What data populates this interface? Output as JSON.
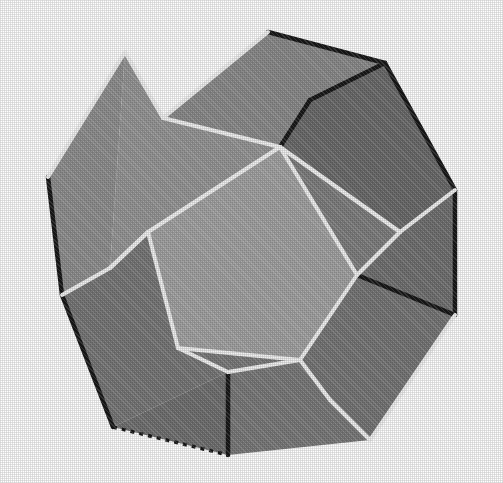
{
  "figure": {
    "shape_name": "regular dodecahedron",
    "face_count": 12,
    "visible_face_count": 11,
    "edge_count": 30,
    "vertex_count": 20,
    "rendering_style": "shaded grayscale halftone with highlighted edges",
    "background_color": "#ffffff",
    "canvas": {
      "width": 503,
      "height": 483
    }
  },
  "palette": {
    "background": "#ffffff",
    "face_brightest": "#a2a2a2",
    "face_light": "#949494",
    "face_mid_light": "#8c8c8c",
    "face_mid": "#848484",
    "face_mid_dark": "#7b7b7b",
    "face_dark": "#6f6f6f",
    "face_darkest": "#676767",
    "edge_highlight": "#f2f2f2",
    "edge_shadow": "#171717",
    "edge_mid": "#5a5a5a"
  },
  "geometry": {
    "note": "Screen-space 2D projection of a dodecahedron. Coordinates in pixels of the 503x483 canvas.",
    "outline": [
      [
        268,
        32
      ],
      [
        385,
        63
      ],
      [
        455,
        190
      ],
      [
        455,
        315
      ],
      [
        370,
        440
      ],
      [
        228,
        455
      ],
      [
        113,
        427
      ],
      [
        62,
        295
      ],
      [
        48,
        177
      ],
      [
        125,
        52
      ]
    ],
    "vertices": {
      "silhouette": {
        "top": [
          268,
          32
        ],
        "upper_right": [
          385,
          63
        ],
        "right_upper": [
          455,
          190
        ],
        "right_lower": [
          455,
          315
        ],
        "lower_right": [
          370,
          440
        ],
        "bottom": [
          228,
          455
        ],
        "lower_left": [
          113,
          427
        ],
        "left_lower": [
          62,
          295
        ],
        "left_upper": [
          48,
          177
        ],
        "upper_left": [
          125,
          52
        ]
      },
      "interior": {
        "top_ridge_left": [
          163,
          118
        ],
        "top_ridge_right": [
          310,
          100
        ],
        "center_top": [
          280,
          147
        ],
        "center_left": [
          148,
          232
        ],
        "center_right": [
          357,
          275
        ],
        "center_low_left": [
          178,
          348
        ],
        "center_low_right": [
          300,
          360
        ],
        "right_mid": [
          400,
          232
        ],
        "left_mid": [
          110,
          268
        ],
        "bottom_mid": [
          228,
          372
        ]
      }
    },
    "faces": [
      {
        "id": "face-center",
        "label": "central pentagon",
        "tone": "#a2a2a2",
        "points": "148,232 280,147 357,275 300,360 178,348"
      },
      {
        "id": "face-top",
        "label": "upper pentagon",
        "tone": "#8a8a8a",
        "points": "163,118 268,32 385,63 310,100 280,147"
      },
      {
        "id": "face-upper-left",
        "label": "upper-left pentagon",
        "tone": "#959595",
        "points": "125,52 163,118 280,147 148,232 110,268"
      },
      {
        "id": "face-left",
        "label": "left pentagon",
        "tone": "#8e8e8e",
        "points": "48,177 125,52 110,268 62,295"
      },
      {
        "id": "face-left-lower",
        "label": "lower-left pentagon",
        "tone": "#767676",
        "points": "62,295 110,268 148,232 178,348 228,372 113,427"
      },
      {
        "id": "face-bottom-left",
        "label": "bottom-left pentagon",
        "tone": "#6f6f6f",
        "points": "113,427 228,372 228,455"
      },
      {
        "id": "face-bottom",
        "label": "bottom pentagon",
        "tone": "#797979",
        "points": "178,348 300,360 330,400 370,440 228,455 228,372"
      },
      {
        "id": "face-lower-right",
        "label": "lower-right pentagon",
        "tone": "#757575",
        "points": "300,360 357,275 455,315 370,440 330,400"
      },
      {
        "id": "face-right",
        "label": "right pentagon",
        "tone": "#707070",
        "points": "357,275 400,232 455,190 455,315"
      },
      {
        "id": "face-upper-right",
        "label": "upper-right pentagon",
        "tone": "#6a6a6a",
        "points": "310,100 385,63 455,190 400,232 280,147"
      },
      {
        "id": "face-right-inner",
        "label": "right inner sliver",
        "tone": "#7d7d7d",
        "points": "280,147 400,232 357,275"
      }
    ],
    "edges": {
      "highlight": [
        "125,52 163,118",
        "163,118 280,147",
        "280,147 148,232",
        "148,232 110,268",
        "110,268 62,295",
        "148,232 178,348",
        "178,348 300,360",
        "300,360 357,275",
        "357,275 280,147",
        "280,147 400,232",
        "400,232 455,190",
        "400,232 357,275",
        "178,348 228,372",
        "228,372 300,360",
        "300,360 330,400",
        "330,400 370,440",
        "455,315 370,440",
        "163,118 268,32",
        "48,177 125,52",
        "110,268 148,232"
      ],
      "shadow": [
        "268,32 385,63",
        "385,63 455,190",
        "455,190 455,315",
        "310,100 385,63",
        "310,100 280,147",
        "228,372 228,455",
        "62,295 113,427",
        "357,275 455,315",
        "48,177 62,295"
      ],
      "dashed": [
        "113,427 228,455"
      ]
    }
  }
}
